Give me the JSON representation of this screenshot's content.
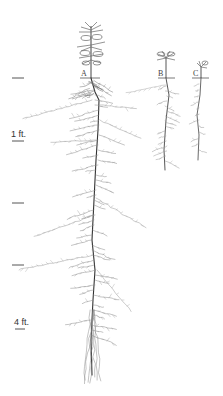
{
  "figure": {
    "scale": {
      "labels": [
        {
          "id": "1ft",
          "text": "1 ft."
        },
        {
          "id": "4ft",
          "text": "4 ft."
        }
      ],
      "tick_count": 5
    },
    "plants": [
      {
        "id": "A",
        "label": "A"
      },
      {
        "id": "B",
        "label": "B"
      },
      {
        "id": "C",
        "label": "C"
      }
    ],
    "colors": {
      "ink": "#555555",
      "ink_dark": "#333333",
      "root_light": "#9a9a9a",
      "background": "#ffffff"
    }
  }
}
